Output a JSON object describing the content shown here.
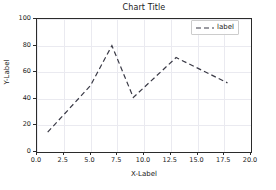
{
  "chart_data": {
    "type": "line",
    "title": "Chart Title",
    "xlabel": "X-Label",
    "ylabel": "Y-Label",
    "xlim": [
      0,
      20
    ],
    "ylim": [
      0,
      100
    ],
    "grid": true,
    "legend_position": "upper right",
    "xticks": [
      "0.0",
      "2.5",
      "5.0",
      "7.5",
      "10.0",
      "12.5",
      "15.0",
      "17.5",
      "20.0"
    ],
    "xtick_values": [
      0,
      2.5,
      5,
      7.5,
      10,
      12.5,
      15,
      17.5,
      20
    ],
    "yticks": [
      "0",
      "20",
      "40",
      "60",
      "80",
      "100"
    ],
    "ytick_values": [
      0,
      20,
      40,
      60,
      80,
      100
    ],
    "series": [
      {
        "name": "label",
        "linestyle": "dashed",
        "color": "#3a3a46",
        "linewidth": 1.2,
        "x": [
          1,
          2.5,
          5,
          7,
          9,
          13,
          17.8
        ],
        "y": [
          15,
          28,
          50,
          80,
          41,
          71,
          52
        ]
      }
    ]
  },
  "legend": {
    "entries": [
      {
        "label": "label",
        "marker": "dashed-line-sample"
      }
    ]
  },
  "colors": {
    "line": "#3a3a46",
    "axis": "#2b2b2b",
    "grid": "#eaeaf0",
    "text": "#1a1a1a",
    "background": "#ffffff"
  }
}
